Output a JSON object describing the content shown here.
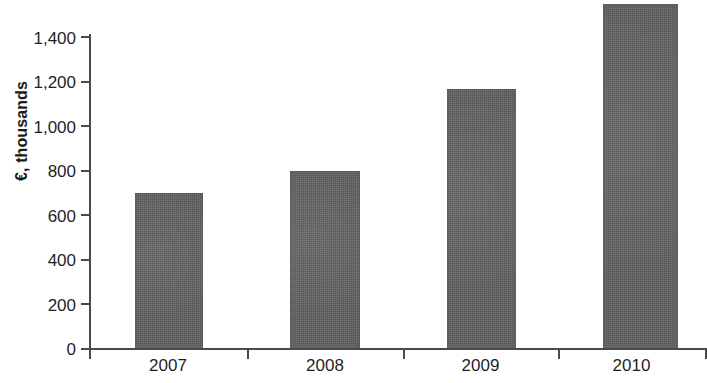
{
  "chart_data": {
    "type": "bar",
    "title": "",
    "subtitle": "",
    "xlabel": "",
    "ylabel": "€, thousands",
    "categories": [
      "2007",
      "2008",
      "2009",
      "2010"
    ],
    "values": [
      700,
      795,
      1165,
      1545
    ],
    "series": [
      {
        "name": "",
        "values": [
          700,
          795,
          1165,
          1545
        ]
      }
    ],
    "ylim": [
      0,
      1545
    ],
    "y_ticks": [
      0,
      200,
      400,
      600,
      800,
      1000,
      1200,
      1400
    ],
    "y_tick_labels": [
      "0",
      "200",
      "400",
      "600",
      "800",
      "1,000",
      "1,200",
      "1,400"
    ],
    "grid": false,
    "legend": false,
    "legend_position": "none",
    "bar_color": "#636363",
    "axis_color": "#4a4a4a",
    "text_color": "#1f1f1f",
    "background_color": "#ffffff"
  }
}
